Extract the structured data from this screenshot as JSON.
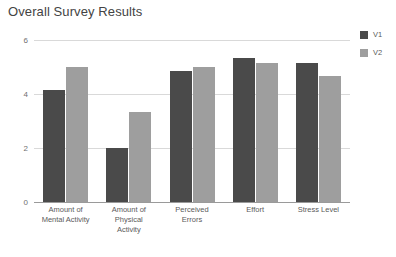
{
  "chart_data": {
    "type": "bar",
    "title": "Overall Survey Results",
    "xlabel": "",
    "ylabel": "",
    "ylim": [
      0,
      6
    ],
    "yticks": [
      0,
      2,
      4,
      6
    ],
    "ytick_labels": [
      "0",
      "2",
      "4",
      "6"
    ],
    "grid": true,
    "legend_position": "right",
    "categories": [
      "Amount of\nMental Activity",
      "Amount of\nPhysical\nActivity",
      "Perceived\nErrors",
      "Effort",
      "Stress Level"
    ],
    "category_labels": [
      {
        "line1": "Amount of",
        "line2": "Mental Activity",
        "line3": ""
      },
      {
        "line1": "Amount of",
        "line2": "Physical",
        "line3": "Activity"
      },
      {
        "line1": "Perceived",
        "line2": "Errors",
        "line3": ""
      },
      {
        "line1": "Effort",
        "line2": "",
        "line3": ""
      },
      {
        "line1": "Stress Level",
        "line2": "",
        "line3": ""
      }
    ],
    "series": [
      {
        "name": "V1",
        "color": "#4a4a4a",
        "values": [
          4.15,
          2.0,
          4.85,
          5.35,
          5.15
        ]
      },
      {
        "name": "V2",
        "color": "#9e9e9e",
        "values": [
          5.0,
          3.35,
          5.0,
          5.15,
          4.65
        ]
      }
    ]
  },
  "legend": {
    "items": [
      {
        "label": "V1",
        "color": "#4a4a4a"
      },
      {
        "label": "V2",
        "color": "#9e9e9e"
      }
    ]
  },
  "colors": {
    "background": "#ffffff",
    "gridline": "#d9d9d9",
    "axis": "#9a9a9a",
    "title_text": "#434343",
    "tick_text": "#6f6f6f",
    "label_text": "#5a5a5a"
  }
}
